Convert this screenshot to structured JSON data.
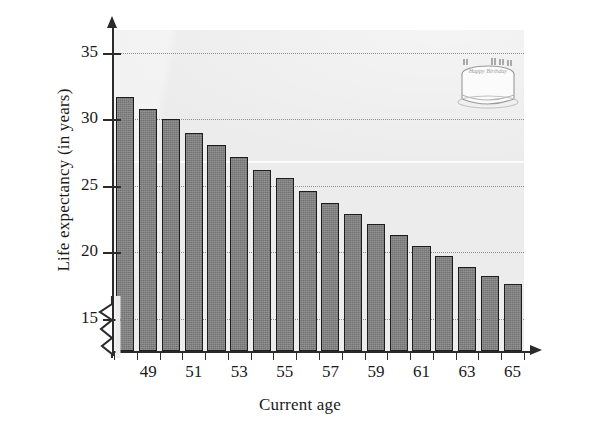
{
  "chart_data": {
    "type": "bar",
    "title": "",
    "xlabel": "Current age",
    "ylabel": "Life expectancy (in years)",
    "categories": [
      48,
      49,
      50,
      51,
      52,
      53,
      54,
      55,
      56,
      57,
      58,
      59,
      60,
      61,
      62,
      63,
      64,
      65
    ],
    "values": [
      31.7,
      30.8,
      30.0,
      29.0,
      28.1,
      27.2,
      26.2,
      25.6,
      24.6,
      23.7,
      22.9,
      22.1,
      21.3,
      20.5,
      19.7,
      18.9,
      18.2,
      17.6
    ],
    "x_tick_labels": [
      "49",
      "51",
      "53",
      "55",
      "57",
      "59",
      "61",
      "63",
      "65"
    ],
    "x_tick_values": [
      49,
      51,
      53,
      55,
      57,
      59,
      61,
      63,
      65
    ],
    "y_tick_labels": [
      "15",
      "20",
      "25",
      "30",
      "35"
    ],
    "y_tick_values": [
      15,
      20,
      25,
      30,
      35
    ],
    "ylim": [
      12.6,
      36.7
    ],
    "xlim": [
      47.5,
      65.5
    ],
    "grid": "horizontal-dotted",
    "legend": "none",
    "y_axis_break": true,
    "bar_color": "#7d7d7d",
    "bar_edge_color": "#1d1d1d",
    "plot_background": "#ececec",
    "gridline_color": "#8e8e8e",
    "axis_color": "#2b2b2b",
    "annotations": [
      {
        "name": "birthday-cake-illustration",
        "text": "Happy Birthday",
        "candles": 6
      }
    ]
  },
  "axes": {
    "y_title": "Life expectancy (in years)",
    "x_title": "Current age"
  }
}
